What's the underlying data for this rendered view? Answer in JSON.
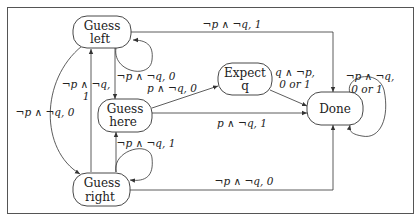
{
  "diagram": {
    "type": "state-machine",
    "nodes": [
      {
        "id": "guess_left",
        "line1": "Guess",
        "line2": "left"
      },
      {
        "id": "guess_here",
        "line1": "Guess",
        "line2": "here"
      },
      {
        "id": "guess_right",
        "line1": "Guess",
        "line2": "right"
      },
      {
        "id": "expect_q",
        "line1": "Expect",
        "line2": "q"
      },
      {
        "id": "done",
        "line1": "Done",
        "line2": ""
      }
    ],
    "edges": [
      {
        "from": "guess_left",
        "to": "done",
        "label": "¬p ∧ ¬q, 1"
      },
      {
        "from": "guess_left",
        "to": "guess_left",
        "label": "¬p ∧ ¬q, 0"
      },
      {
        "from": "guess_left",
        "to": "guess_here",
        "label": "¬p ∧ ¬q, 0"
      },
      {
        "from": "guess_left",
        "to": "guess_right",
        "label": "¬p ∧ ¬q, 0"
      },
      {
        "from": "guess_right",
        "to": "guess_left",
        "label_line1": "¬p ∧ ¬q,",
        "label_line2": "1"
      },
      {
        "from": "guess_here",
        "to": "expect_q",
        "label": "p ∧ ¬q, 0"
      },
      {
        "from": "guess_here",
        "to": "done",
        "label": "p ∧ ¬q, 1"
      },
      {
        "from": "expect_q",
        "to": "done",
        "label_line1": "q ∧ ¬p,",
        "label_line2": "0 or 1"
      },
      {
        "from": "done",
        "to": "done",
        "label_line1": "¬p ∧ ¬q,",
        "label_line2": "0 or 1"
      },
      {
        "from": "guess_right",
        "to": "guess_here",
        "label": "¬p ∧ ¬q, 1"
      },
      {
        "from": "guess_right",
        "to": "done",
        "label": "¬p ∧ ¬q, 0"
      }
    ]
  },
  "labels": {
    "gl_done": "¬p ∧ ¬q, 1",
    "gl_self_here": "¬p ∧ ¬q, 0",
    "gh_expect": "p ∧ ¬q, 0",
    "gr_gl_1": "¬p ∧ ¬q,",
    "gr_gl_2": "1",
    "gl_gr": "¬p ∧ ¬q, 0",
    "gh_done": "p ∧ ¬q, 1",
    "eq_done_1": "q ∧ ¬p,",
    "eq_done_2": "0 or 1",
    "done_self_1": "¬p ∧ ¬q,",
    "done_self_2": "0 or 1",
    "gr_self_here": "¬p ∧ ¬q, 1",
    "gr_done": "¬p ∧ ¬q, 0"
  },
  "colors": {
    "stroke": "#333333",
    "frame": "#555555",
    "background": "#ffffff"
  }
}
